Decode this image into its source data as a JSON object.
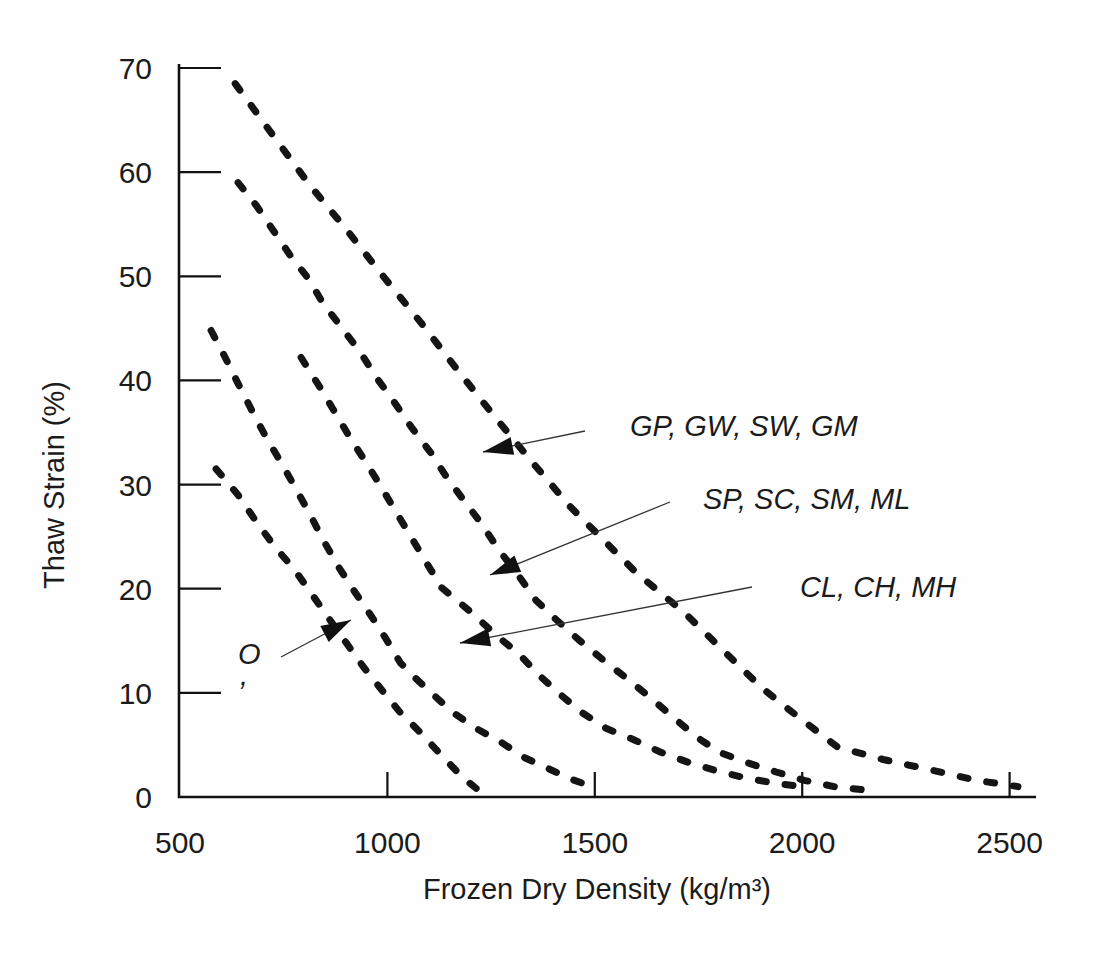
{
  "chart_data": {
    "type": "line",
    "title": "",
    "xlabel": "Frozen Dry Density (kg/m³)",
    "ylabel": "Thaw Strain (%)",
    "xlim": [
      500,
      2570
    ],
    "ylim": [
      0,
      70
    ],
    "x_ticks_labeled": [
      500,
      1000,
      1500,
      2000,
      2500
    ],
    "x_ticks_marked": [
      1000,
      1500,
      2000,
      2500
    ],
    "y_ticks_labeled": [
      0,
      10,
      20,
      30,
      40,
      50,
      60,
      70
    ],
    "y_ticks_marked": [
      10,
      20,
      30,
      40,
      50,
      60,
      70
    ],
    "grid": false,
    "line_style": "dashed",
    "legend_position": "arrow-annotated labels inside plot",
    "series": [
      {
        "name": "GP-GW-SW-GM upper boundary",
        "points": [
          [
            633,
            68.5
          ],
          [
            723,
            63.6
          ],
          [
            812,
            58.8
          ],
          [
            901,
            54.5
          ],
          [
            990,
            50.0
          ],
          [
            1082,
            45.5
          ],
          [
            1171,
            40.9
          ],
          [
            1257,
            36.6
          ],
          [
            1348,
            32.2
          ],
          [
            1440,
            27.9
          ],
          [
            1533,
            24.2
          ],
          [
            1601,
            21.5
          ],
          [
            1713,
            17.8
          ],
          [
            1809,
            14.1
          ],
          [
            1905,
            10.4
          ],
          [
            1990,
            7.7
          ],
          [
            2085,
            4.8
          ],
          [
            2195,
            3.6
          ],
          [
            2310,
            2.6
          ],
          [
            2420,
            1.6
          ],
          [
            2520,
            1.0
          ]
        ]
      },
      {
        "name": "GP-band / SP-band boundary",
        "points": [
          [
            640,
            59.0
          ],
          [
            684,
            56.8
          ],
          [
            725,
            54.4
          ],
          [
            766,
            52.0
          ],
          [
            809,
            49.8
          ],
          [
            845,
            47.4
          ],
          [
            889,
            45.1
          ],
          [
            935,
            42.7
          ],
          [
            973,
            40.3
          ],
          [
            1010,
            38.3
          ],
          [
            1058,
            35.5
          ],
          [
            1104,
            33.1
          ],
          [
            1143,
            30.7
          ],
          [
            1184,
            28.5
          ],
          [
            1220,
            26.6
          ],
          [
            1273,
            23.5
          ],
          [
            1312,
            21.5
          ],
          [
            1358,
            18.9
          ],
          [
            1408,
            17.0
          ],
          [
            1461,
            15.1
          ],
          [
            1522,
            13.1
          ],
          [
            1577,
            11.4
          ],
          [
            1635,
            9.5
          ],
          [
            1691,
            7.6
          ],
          [
            1744,
            5.8
          ],
          [
            1800,
            4.3
          ],
          [
            1867,
            3.3
          ],
          [
            1937,
            2.4
          ],
          [
            2005,
            1.6
          ],
          [
            2077,
            1.0
          ],
          [
            2145,
            0.7
          ]
        ]
      },
      {
        "name": "SP-band / CL-band boundary",
        "points": [
          [
            792,
            42.2
          ],
          [
            838,
            39.3
          ],
          [
            877,
            36.7
          ],
          [
            913,
            34.3
          ],
          [
            949,
            32.1
          ],
          [
            986,
            29.7
          ],
          [
            1022,
            27.3
          ],
          [
            1058,
            24.9
          ],
          [
            1094,
            22.5
          ],
          [
            1131,
            20.1
          ],
          [
            1152,
            19.4
          ],
          [
            1203,
            17.7
          ],
          [
            1263,
            15.5
          ],
          [
            1316,
            13.8
          ],
          [
            1360,
            11.9
          ],
          [
            1418,
            9.8
          ],
          [
            1469,
            8.1
          ],
          [
            1527,
            6.6
          ],
          [
            1594,
            5.5
          ],
          [
            1659,
            4.3
          ],
          [
            1727,
            3.3
          ],
          [
            1795,
            2.5
          ],
          [
            1867,
            1.8
          ],
          [
            1940,
            1.3
          ],
          [
            2020,
            0.9
          ]
        ]
      },
      {
        "name": "CL-band / O-band boundary",
        "points": [
          [
            575,
            44.8
          ],
          [
            609,
            42.2
          ],
          [
            640,
            39.7
          ],
          [
            676,
            36.9
          ],
          [
            708,
            34.5
          ],
          [
            744,
            32.1
          ],
          [
            778,
            29.7
          ],
          [
            814,
            27.1
          ],
          [
            845,
            24.7
          ],
          [
            882,
            22.1
          ],
          [
            918,
            19.9
          ],
          [
            959,
            17.5
          ],
          [
            995,
            15.3
          ],
          [
            1031,
            12.9
          ],
          [
            1068,
            11.4
          ],
          [
            1106,
            10.0
          ],
          [
            1155,
            8.2
          ],
          [
            1213,
            6.6
          ],
          [
            1273,
            5.3
          ],
          [
            1329,
            3.8
          ],
          [
            1384,
            2.8
          ],
          [
            1437,
            1.8
          ],
          [
            1500,
            0.9
          ]
        ]
      },
      {
        "name": "O lower boundary",
        "points": [
          [
            587,
            31.5
          ],
          [
            640,
            29.0
          ],
          [
            681,
            26.6
          ],
          [
            729,
            24.0
          ],
          [
            773,
            22.0
          ],
          [
            814,
            19.7
          ],
          [
            858,
            17.2
          ],
          [
            899,
            14.9
          ],
          [
            942,
            12.5
          ],
          [
            986,
            10.3
          ],
          [
            1031,
            8.1
          ],
          [
            1082,
            6.1
          ],
          [
            1130,
            4.0
          ],
          [
            1184,
            1.8
          ],
          [
            1215,
            0.8
          ]
        ]
      }
    ],
    "bands": [
      {
        "label": "GP, GW, SW, GM",
        "upper_curve": 0,
        "lower_curve": 1
      },
      {
        "label": "SP, SC, SM, ML",
        "upper_curve": 1,
        "lower_curve": 2
      },
      {
        "label": "CL, CH, MH",
        "upper_curve": 2,
        "lower_curve": 3
      },
      {
        "label": "O",
        "upper_curve": 3,
        "lower_curve": 4
      }
    ],
    "annotations": [
      {
        "text": "GP, GW, SW, GM",
        "text_x": 630,
        "text_y": 436,
        "anchor": "start",
        "arrow": [
          585,
          431,
          483,
          452
        ]
      },
      {
        "text": "SP, SC, SM, ML",
        "text_x": 703,
        "text_y": 509,
        "anchor": "start",
        "arrow": [
          670,
          502,
          490,
          575
        ]
      },
      {
        "text": "CL, CH, MH",
        "text_x": 800,
        "text_y": 597,
        "anchor": "start",
        "arrow": [
          752,
          587,
          460,
          643
        ]
      },
      {
        "text": "O",
        "text_x": 238,
        "text_y": 664,
        "anchor": "start",
        "arrow": [
          281,
          657,
          351,
          620
        ]
      },
      {
        "text": ",",
        "text_x": 240,
        "text_y": 685,
        "anchor": "start",
        "arrow": null
      }
    ],
    "colors": {
      "curve": "#151515",
      "axis": "#111111",
      "text": "#1b1b1b",
      "background": "#fefefe"
    }
  }
}
